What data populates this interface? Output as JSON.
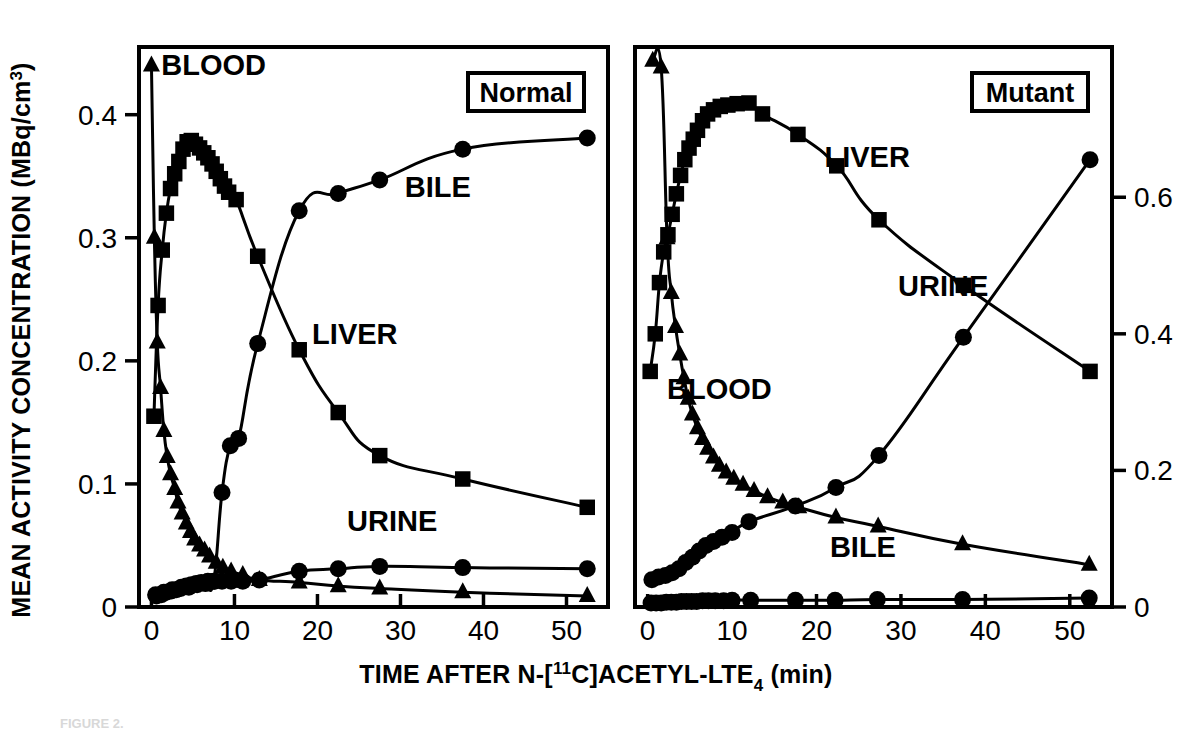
{
  "figure": {
    "y_axis_title_main": "MEAN ACTIVITY CONCENTRATION (MBq/cm",
    "y_axis_title_sup": "3",
    "y_axis_title_close": ")",
    "x_axis_title_part1": "TIME AFTER N-[",
    "x_axis_title_sup": "11",
    "x_axis_title_part2": "C]ACETYL-LTE",
    "x_axis_title_sub": "4",
    "x_axis_title_part3": " (min)",
    "caption": "FIGURE 2."
  },
  "chart_data": [
    {
      "type": "line",
      "panel": "left",
      "title": "Normal",
      "xlabel": "TIME AFTER N-[11C]ACETYL-LTE4 (min)",
      "ylabel": "MEAN ACTIVITY CONCENTRATION (MBq/cm3)",
      "xlim": [
        -1.5,
        55
      ],
      "ylim": [
        0,
        0.455
      ],
      "xticks": [
        0,
        10,
        20,
        30,
        40,
        50
      ],
      "xticklabels": [
        "0",
        "10",
        "20",
        "30",
        "40",
        "50"
      ],
      "yticks": [
        0,
        0.1,
        0.2,
        0.3,
        0.4
      ],
      "yticklabels": [
        "0",
        "0.1",
        "0.2",
        "0.3",
        "0.4"
      ],
      "yaxis_side": "left",
      "grid": false,
      "legend": "inline-annotations",
      "series": [
        {
          "name": "BLOOD",
          "marker": "triangle",
          "label_x": 7.5,
          "label_y": 0.432,
          "x": [
            0.0,
            0.35,
            0.7,
            1.1,
            1.5,
            1.9,
            2.3,
            2.8,
            3.2,
            3.7,
            4.2,
            4.7,
            5.2,
            5.8,
            6.4,
            7.0,
            7.8,
            8.6,
            9.6,
            11.0,
            13.0,
            17.8,
            22.5,
            27.5,
            37.5,
            52.5
          ],
          "y": [
            0.44,
            0.3,
            0.215,
            0.178,
            0.143,
            0.122,
            0.108,
            0.096,
            0.085,
            0.076,
            0.068,
            0.061,
            0.055,
            0.05,
            0.046,
            0.041,
            0.036,
            0.032,
            0.029,
            0.026,
            0.022,
            0.02,
            0.017,
            0.015,
            0.012,
            0.009
          ]
        },
        {
          "name": "LIVER",
          "marker": "square",
          "label_x": 24.5,
          "label_y": 0.214,
          "x": [
            0.3,
            0.8,
            1.3,
            1.8,
            2.3,
            2.8,
            3.3,
            3.8,
            4.3,
            4.8,
            5.3,
            5.8,
            6.3,
            6.8,
            7.3,
            7.8,
            8.3,
            8.8,
            9.3,
            10.2,
            12.8,
            17.8,
            22.5,
            27.5,
            37.5,
            52.5
          ],
          "y": [
            0.155,
            0.245,
            0.29,
            0.32,
            0.34,
            0.352,
            0.362,
            0.372,
            0.378,
            0.379,
            0.376,
            0.373,
            0.369,
            0.365,
            0.36,
            0.354,
            0.348,
            0.342,
            0.337,
            0.331,
            0.285,
            0.209,
            0.158,
            0.123,
            0.104,
            0.081
          ]
        },
        {
          "name": "BILE",
          "marker": "circle",
          "label_x": 34.5,
          "label_y": 0.333,
          "x": [
            0.5,
            1.5,
            2.5,
            3.5,
            4.5,
            5.5,
            6.5,
            7.5,
            8.5,
            9.5,
            10.5,
            12.8,
            17.8,
            22.5,
            27.5,
            37.5,
            52.5
          ],
          "y": [
            0.01,
            0.012,
            0.014,
            0.015,
            0.016,
            0.018,
            0.019,
            0.021,
            0.093,
            0.131,
            0.137,
            0.214,
            0.322,
            0.336,
            0.347,
            0.372,
            0.381
          ]
        },
        {
          "name": "URINE",
          "marker": "circle",
          "label_x": 29.0,
          "label_y": 0.062,
          "x": [
            0.6,
            1.2,
            1.8,
            2.4,
            3.0,
            3.6,
            4.2,
            4.8,
            5.4,
            6.0,
            6.8,
            7.6,
            8.5,
            9.6,
            11.0,
            13.0,
            17.8,
            22.5,
            27.5,
            37.5,
            52.5
          ],
          "y": [
            0.009,
            0.01,
            0.012,
            0.013,
            0.014,
            0.016,
            0.017,
            0.018,
            0.019,
            0.02,
            0.021,
            0.021,
            0.021,
            0.021,
            0.021,
            0.022,
            0.029,
            0.031,
            0.033,
            0.032,
            0.031
          ]
        }
      ]
    },
    {
      "type": "line",
      "panel": "right",
      "title": "Mutant",
      "xlabel": "TIME AFTER N-[11C]ACETYL-LTE4 (min)",
      "ylabel": "MEAN ACTIVITY CONCENTRATION (MBq/cm3)",
      "xlim": [
        -1.5,
        55
      ],
      "ylim": [
        0,
        0.82
      ],
      "xticks": [
        0,
        10,
        20,
        30,
        40,
        50
      ],
      "xticklabels": [
        "0",
        "10",
        "20",
        "30",
        "40",
        "50"
      ],
      "yticks": [
        0,
        0.2,
        0.4,
        0.6
      ],
      "yticklabels": [
        "0",
        "0.2",
        "0.4",
        "0.6"
      ],
      "yaxis_side": "right",
      "grid": false,
      "legend": "inline-annotations",
      "series": [
        {
          "name": "BLOOD",
          "marker": "triangle",
          "label_x": 8.5,
          "label_y": 0.305,
          "x": [
            0.6,
            1.6,
            2.3,
            2.8,
            3.3,
            3.8,
            4.3,
            4.8,
            5.3,
            5.9,
            6.5,
            7.1,
            7.8,
            8.5,
            9.3,
            10.2,
            11.3,
            12.6,
            14.2,
            16.0,
            17.9,
            22.3,
            27.3,
            37.3,
            52.3
          ],
          "y": [
            0.8,
            0.79,
            0.54,
            0.46,
            0.41,
            0.37,
            0.335,
            0.305,
            0.282,
            0.262,
            0.246,
            0.232,
            0.219,
            0.207,
            0.197,
            0.188,
            0.179,
            0.17,
            0.161,
            0.153,
            0.146,
            0.131,
            0.118,
            0.092,
            0.062
          ]
        },
        {
          "name": "LIVER",
          "marker": "square",
          "label_x": 26.0,
          "label_y": 0.645,
          "x": [
            0.3,
            0.9,
            1.4,
            1.9,
            2.4,
            2.9,
            3.4,
            3.9,
            4.4,
            4.9,
            5.4,
            5.9,
            6.5,
            7.1,
            7.8,
            8.6,
            9.5,
            10.6,
            12.0,
            13.6,
            17.8,
            22.4,
            27.4,
            37.4,
            52.4
          ],
          "y": [
            0.345,
            0.4,
            0.475,
            0.52,
            0.545,
            0.575,
            0.605,
            0.632,
            0.655,
            0.672,
            0.685,
            0.698,
            0.712,
            0.722,
            0.728,
            0.733,
            0.735,
            0.737,
            0.738,
            0.722,
            0.692,
            0.646,
            0.567,
            0.471,
            0.345
          ]
        },
        {
          "name": "URINE",
          "marker": "circle",
          "label_x": 35.0,
          "label_y": 0.455,
          "x": [
            0.5,
            1.3,
            2.1,
            2.9,
            3.7,
            4.5,
            5.3,
            6.1,
            6.9,
            7.8,
            8.8,
            10.0,
            12.0,
            17.5,
            22.3,
            27.4,
            37.4,
            52.4
          ],
          "y": [
            0.04,
            0.044,
            0.046,
            0.05,
            0.056,
            0.065,
            0.073,
            0.082,
            0.09,
            0.096,
            0.102,
            0.109,
            0.125,
            0.148,
            0.175,
            0.222,
            0.395,
            0.655
          ]
        },
        {
          "name": "BILE",
          "marker": "circle",
          "label_x": 25.5,
          "label_y": 0.073,
          "x": [
            0.4,
            1.0,
            1.6,
            2.2,
            2.8,
            3.4,
            4.0,
            4.6,
            5.2,
            5.8,
            6.5,
            7.2,
            8.0,
            9.0,
            10.0,
            12.2,
            17.5,
            22.2,
            27.2,
            37.3,
            52.3
          ],
          "y": [
            0.006,
            0.006,
            0.006,
            0.007,
            0.007,
            0.007,
            0.008,
            0.008,
            0.008,
            0.008,
            0.009,
            0.009,
            0.009,
            0.009,
            0.01,
            0.01,
            0.01,
            0.01,
            0.011,
            0.011,
            0.013
          ]
        }
      ]
    }
  ]
}
